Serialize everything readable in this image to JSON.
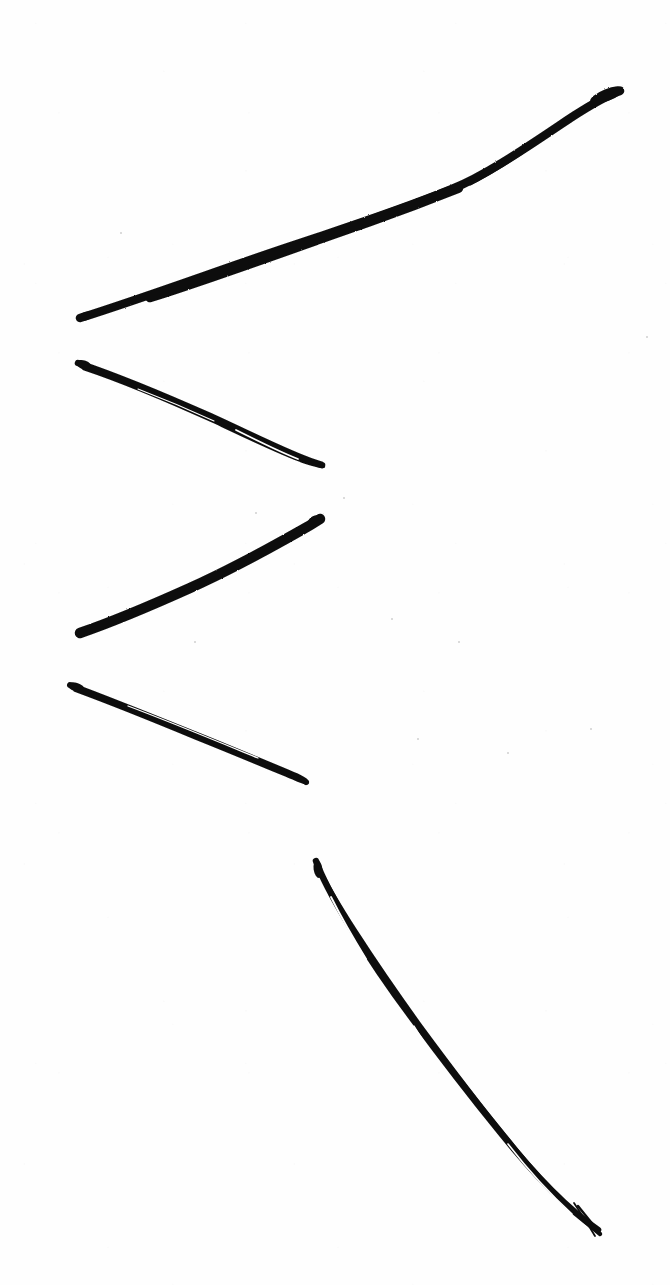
{
  "image": {
    "title": "Hand-drawn ink strokes",
    "description": "Scanned sheet of white paper bearing five isolated black ink pen strokes arranged as a loose zigzag / chevron pattern down the page",
    "width": 670,
    "height": 1285,
    "background_color": "#fefefe",
    "ink_color": "#0d0d0d",
    "medium": "ink pen on paper, scanned",
    "stroke_count": 5
  },
  "strokes": [
    {
      "id": "stroke-1",
      "name": "long-ascending-stroke",
      "description": "Longest stroke, ascends from lower-left to upper-right, thickening into a blunt blob at the top-right tip",
      "direction": "up-right",
      "start": {
        "x": 80,
        "y": 318
      },
      "end": {
        "x": 622,
        "y": 91
      },
      "length_px": 588,
      "angle_deg": -22.7,
      "max_thickness_px": 11,
      "min_thickness_px": 4,
      "doubled": false,
      "path": "M80,318 C150,296 230,266 300,243 C370,220 420,202 452,189 C482,177 520,152 560,125 C585,108 606,96 620,91",
      "widths": [
        7,
        9,
        10,
        9,
        8,
        6,
        5,
        6,
        9,
        11
      ],
      "tip_start": "tapered",
      "tip_end": "blob"
    },
    {
      "id": "stroke-2",
      "name": "short-descending-stroke-upper",
      "description": "Descends left-to-right, visibly retraced so a white hairline splits the ink along most of its length",
      "direction": "down-right",
      "start": {
        "x": 78,
        "y": 363
      },
      "end": {
        "x": 323,
        "y": 465
      },
      "length_px": 265,
      "angle_deg": 22.6,
      "max_thickness_px": 9,
      "min_thickness_px": 3,
      "doubled": true,
      "path": "M78,363 C120,377 165,396 210,416 C245,432 275,447 300,457 C312,462 319,464 322,465",
      "path_secondary": "M84,368 C126,382 170,401 214,421 C248,437 277,451 301,460 C313,464 320,466 323,466",
      "widths": [
        8,
        8,
        7,
        6,
        5,
        4,
        4,
        5,
        6
      ],
      "tip_start": "blunt",
      "tip_end": "tapered"
    },
    {
      "id": "stroke-3",
      "name": "ascending-stroke-middle",
      "description": "Thick solid ascending stroke with a sharp tapered tail at the lower-left and a rounded blunt tip at the upper-right",
      "direction": "up-right",
      "start": {
        "x": 80,
        "y": 633
      },
      "end": {
        "x": 321,
        "y": 518
      },
      "length_px": 267,
      "angle_deg": -25.5,
      "max_thickness_px": 11,
      "min_thickness_px": 2,
      "doubled": false,
      "path": "M80,633 C112,622 150,606 190,588 C230,570 270,548 300,531 C311,525 317,521 320,519",
      "widths": [
        2,
        6,
        9,
        10,
        11,
        11,
        10,
        9,
        9
      ],
      "tip_start": "sharp-taper",
      "tip_end": "rounded"
    },
    {
      "id": "stroke-4",
      "name": "short-descending-stroke-lower",
      "description": "Thin descending stroke, retraced with a hairline white gap along the lower edge",
      "direction": "down-right",
      "start": {
        "x": 70,
        "y": 685
      },
      "end": {
        "x": 307,
        "y": 782
      },
      "length_px": 256,
      "angle_deg": 22.2,
      "max_thickness_px": 8,
      "min_thickness_px": 3,
      "doubled": true,
      "path": "M70,685 C108,699 150,716 192,733 C232,749 272,766 296,776 C302,779 305,781 306,782",
      "path_secondary": "M75,690 C113,704 155,721 196,738 C236,754 274,770 298,780 C303,782 306,783 307,783",
      "widths": [
        7,
        7,
        6,
        6,
        5,
        5,
        4,
        4,
        4
      ],
      "tip_start": "blunt-flag",
      "tip_end": "tapered"
    },
    {
      "id": "stroke-5",
      "name": "long-descending-stroke-bottom",
      "description": "Longest descending stroke at the bottom, retraced twice so lens-shaped white gaps open along it; the lower tip forks into two fine tails",
      "direction": "down-right",
      "start": {
        "x": 316,
        "y": 861
      },
      "end": {
        "x": 601,
        "y": 1232
      },
      "length_px": 468,
      "angle_deg": 52.5,
      "max_thickness_px": 9,
      "min_thickness_px": 2,
      "doubled": true,
      "path": "M316,861 C322,878 334,900 349,925 C366,953 388,986 412,1018 C440,1056 470,1095 500,1132 C532,1172 566,1208 598,1230",
      "path_secondary": "M318,866 C326,884 340,907 356,932 C374,960 396,992 419,1024 C447,1062 476,1101 506,1137 C536,1175 570,1210 600,1234",
      "widths": [
        6,
        7,
        7,
        6,
        6,
        5,
        5,
        4,
        4,
        3
      ],
      "tip_start": "rounded-club",
      "tip_end": "forked"
    }
  ],
  "specks": [
    {
      "x": 343,
      "y": 497,
      "size": 2
    },
    {
      "x": 255,
      "y": 512,
      "size": 2
    },
    {
      "x": 194,
      "y": 641,
      "size": 2
    },
    {
      "x": 458,
      "y": 641,
      "size": 2
    },
    {
      "x": 391,
      "y": 618,
      "size": 2
    },
    {
      "x": 590,
      "y": 728,
      "size": 2
    },
    {
      "x": 417,
      "y": 738,
      "size": 2
    },
    {
      "x": 507,
      "y": 752,
      "size": 2
    },
    {
      "x": 120,
      "y": 232,
      "size": 2
    },
    {
      "x": 646,
      "y": 336,
      "size": 2
    }
  ]
}
